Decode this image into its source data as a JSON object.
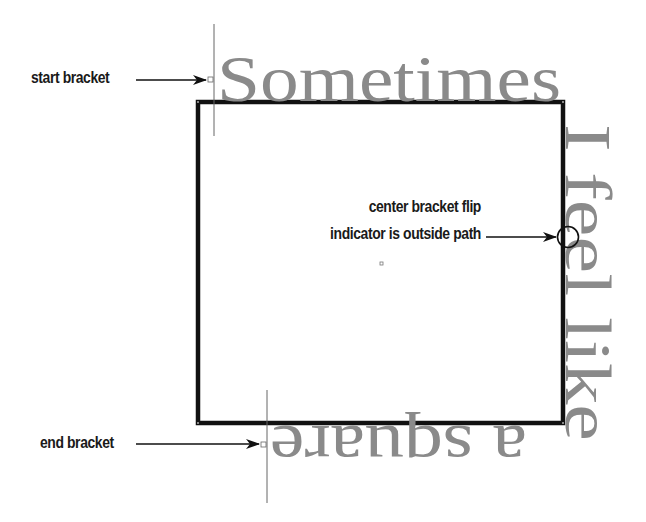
{
  "diagram": {
    "path_shape": "square",
    "path_text": {
      "top": "Sometimes",
      "right": "I feel like",
      "bottom": "a square"
    },
    "annotations": {
      "start_bracket": "start bracket",
      "end_bracket": "end bracket",
      "center_line1": "center bracket flip",
      "center_line2": "indicator is outside path"
    },
    "colors": {
      "path_stroke": "#111111",
      "path_text": "#8a8a8a",
      "bracket_line": "#777777",
      "annotation_text": "#1a1a1a"
    }
  }
}
